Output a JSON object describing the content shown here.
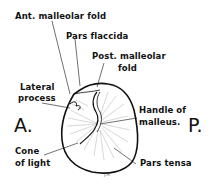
{
  "diagram": {
    "orientation": {
      "anterior": "A.",
      "posterior": "P."
    },
    "labels": {
      "ant_malleolar_fold": "Ant. malleolar fold",
      "pars_flaccida": "Pars flaccida",
      "post_malleolar_fold_1": "Post. malleolar",
      "post_malleolar_fold_2": "fold",
      "lateral_process_1": "Lateral",
      "lateral_process_2": "process",
      "handle_of_malleus_1": "Handle of",
      "handle_of_malleus_2": "malleus.",
      "cone_of_light_1": "Cone",
      "cone_of_light_2": "of light",
      "pars_tensa": "Pars tensa"
    },
    "signature": "J.H.",
    "colors": {
      "ink": "#111111",
      "background": "#ffffff"
    }
  }
}
